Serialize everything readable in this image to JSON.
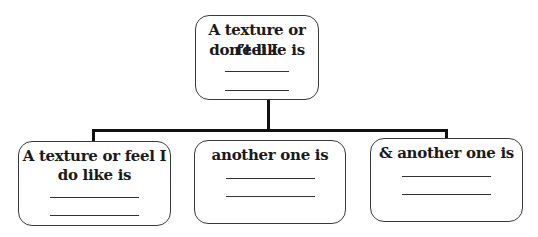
{
  "diagram": {
    "type": "tree",
    "root": {
      "label_line1": "A texture or feel I",
      "label_line2": "don’t like is",
      "blanks": 2
    },
    "children": [
      {
        "label_line1": "A texture or feel I",
        "label_line2": "do like is",
        "blanks": 2
      },
      {
        "label_line1": "another one is",
        "label_line2": "",
        "blanks": 2
      },
      {
        "label_line1": "& another one is",
        "label_line2": "",
        "blanks": 2
      }
    ],
    "colors": {
      "border": "#3a3a3a",
      "connector": "#111111",
      "text": "#1a1a1a",
      "background": "#ffffff"
    }
  }
}
